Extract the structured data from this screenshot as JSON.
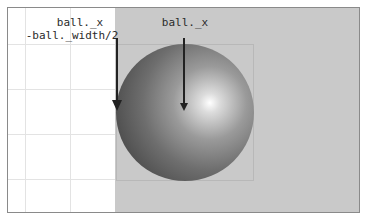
{
  "diagram": {
    "labels": {
      "left_line1": "ball._x",
      "left_line2": "-ball._width/2",
      "center": "ball._x"
    },
    "colors": {
      "background": "#ffffff",
      "stage": "#c9c9c9",
      "ball_dark": "#3c3c3c",
      "ball_highlight": "#ffffff",
      "arrow": "#222222",
      "border": "#8a8a8a"
    },
    "ball": {
      "left": 115,
      "top": 43,
      "diameter": 138
    },
    "arrows": [
      {
        "name": "left-edge-arrow",
        "x": 118,
        "y1": 36,
        "y2": 110
      },
      {
        "name": "center-arrow",
        "x": 184,
        "y1": 36,
        "y2": 110
      }
    ]
  }
}
